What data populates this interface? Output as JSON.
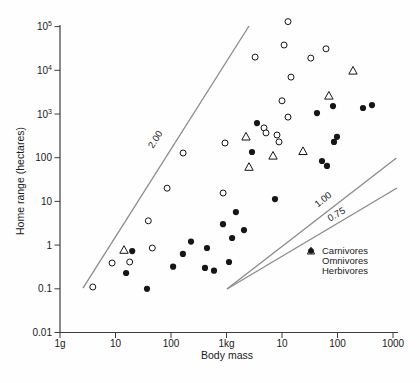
{
  "figure": {
    "background": "#fefefe",
    "text_color": "#1a1a1a",
    "marker_color": "#161616",
    "ref_line_color": "#8a8a8a",
    "axis_color": "#3c3c3c"
  },
  "chart_data": {
    "type": "scatter",
    "xlabel": "Body mass",
    "ylabel": "Home range (hectares)",
    "x_scale": "log",
    "y_scale": "log",
    "x_range_g": [
      1,
      1000000
    ],
    "y_range_ha": [
      0.01,
      100000
    ],
    "grid": false,
    "x_ticks": [
      {
        "v": 1,
        "label": "1g"
      },
      {
        "v": 10,
        "label": "10"
      },
      {
        "v": 100,
        "label": "100"
      },
      {
        "v": 1000,
        "label": "1kg"
      },
      {
        "v": 10000,
        "label": "10"
      },
      {
        "v": 100000,
        "label": "100"
      },
      {
        "v": 1000000,
        "label": "1000"
      }
    ],
    "y_ticks": [
      {
        "v": 100000,
        "label": "10",
        "sup": "5"
      },
      {
        "v": 10000,
        "label": "10",
        "sup": "4"
      },
      {
        "v": 1000,
        "label": "10",
        "sup": "3"
      },
      {
        "v": 100,
        "label": "100",
        "sup": ""
      },
      {
        "v": 10,
        "label": "10",
        "sup": ""
      },
      {
        "v": 1,
        "label": "1",
        "sup": ""
      },
      {
        "v": 0.1,
        "label": "0.1",
        "sup": ""
      },
      {
        "v": 0.01,
        "label": "0.01",
        "sup": ""
      }
    ],
    "series": [
      {
        "name": "Carnivores",
        "marker": "open-circle",
        "points_g_ha": [
          [
            3.9,
            0.11
          ],
          [
            8.7,
            0.39
          ],
          [
            18,
            0.41
          ],
          [
            39,
            3.6
          ],
          [
            46,
            0.86
          ],
          [
            85,
            20
          ],
          [
            165,
            128
          ],
          [
            870,
            15.6
          ],
          [
            940,
            217
          ],
          [
            3270,
            20000
          ],
          [
            4740,
            480
          ],
          [
            5150,
            370
          ],
          [
            8130,
            330
          ],
          [
            8830,
            230
          ],
          [
            10000,
            2000
          ],
          [
            10900,
            38000
          ],
          [
            12800,
            130000
          ],
          [
            12800,
            850
          ],
          [
            14500,
            7000
          ],
          [
            33000,
            19000
          ],
          [
            62000,
            31000
          ]
        ]
      },
      {
        "name": "Omnivores",
        "marker": "open-triangle",
        "points_g_ha": [
          [
            14.2,
            0.77
          ],
          [
            2250,
            300
          ],
          [
            2540,
            61
          ],
          [
            6870,
            110
          ],
          [
            23900,
            140
          ],
          [
            70000,
            2600
          ],
          [
            190000,
            9700
          ]
        ]
      },
      {
        "name": "Herbivores",
        "marker": "filled-circle",
        "points_g_ha": [
          [
            15.5,
            0.23
          ],
          [
            20,
            0.73
          ],
          [
            37,
            0.1
          ],
          [
            109,
            0.32
          ],
          [
            164,
            0.63
          ],
          [
            229,
            1.2
          ],
          [
            410,
            0.3
          ],
          [
            446,
            0.86
          ],
          [
            595,
            0.26
          ],
          [
            865,
            3.0
          ],
          [
            1110,
            0.41
          ],
          [
            1260,
            1.45
          ],
          [
            1480,
            5.7
          ],
          [
            2070,
            2.2
          ],
          [
            2880,
            135
          ],
          [
            3550,
            620
          ],
          [
            7480,
            11.3
          ],
          [
            42800,
            1050
          ],
          [
            52600,
            84
          ],
          [
            64700,
            65
          ],
          [
            83000,
            1520
          ],
          [
            86500,
            230
          ],
          [
            98000,
            300
          ],
          [
            288000,
            1370
          ],
          [
            419000,
            1600
          ]
        ]
      }
    ],
    "reference_lines": [
      {
        "label": "2.00",
        "from_g_ha": [
          2.6,
          0.104
        ],
        "to_g_ha": [
          2540,
          103000
        ],
        "label_at_g_ha": [
          58,
          240
        ],
        "label_angle": -57.5
      },
      {
        "label": "1.00",
        "from_g_ha": [
          1020,
          0.099
        ],
        "to_g_ha": [
          1150000,
          98
        ],
        "label_at_g_ha": [
          59600,
          9.7
        ],
        "label_angle": -38
      },
      {
        "label": "0.75",
        "from_g_ha": [
          1020,
          0.099
        ],
        "to_g_ha": [
          1180000,
          20.3
        ],
        "label_at_g_ha": [
          102000,
          4.4
        ],
        "label_angle": -31
      }
    ],
    "legend": {
      "position": "lower-right",
      "items": [
        {
          "label": "Carnivores",
          "marker": "open-circle"
        },
        {
          "label": "Omnivores",
          "marker": "open-triangle"
        },
        {
          "label": "Herbivores",
          "marker": "filled-circle"
        }
      ]
    }
  }
}
